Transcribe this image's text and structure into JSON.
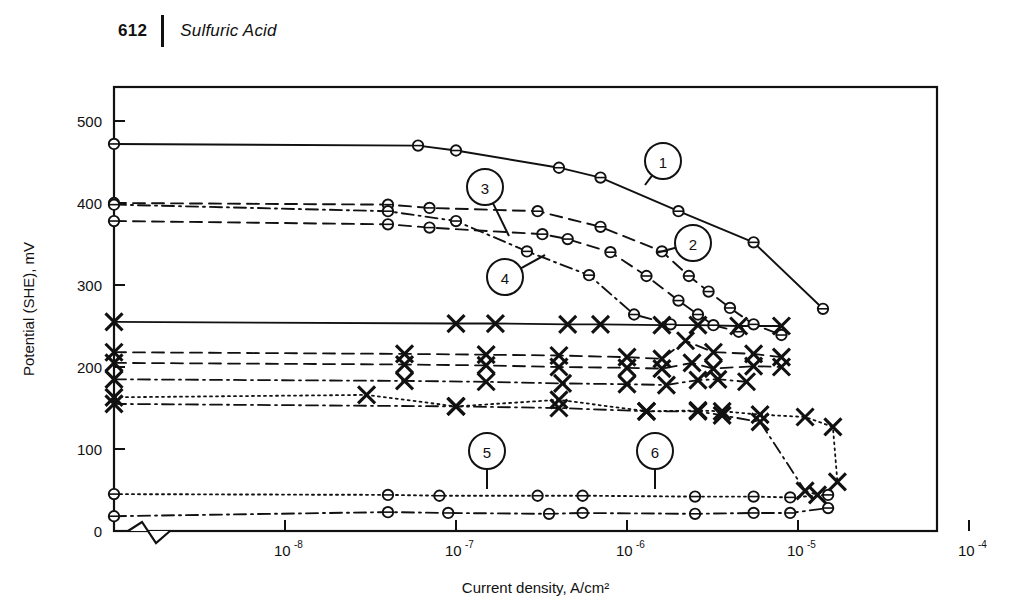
{
  "page": {
    "number": "612",
    "running_title": "Sulfuric Acid"
  },
  "chart_data": {
    "type": "line",
    "title": "",
    "xlabel": "Current density, A/cm²",
    "ylabel": "Potential (SHE), mV",
    "xscale": "log",
    "xlim": [
      1e-09,
      0.0001
    ],
    "ylim": [
      0,
      520
    ],
    "yticks": [
      0,
      100,
      200,
      300,
      400,
      500
    ],
    "xticks": [
      1e-08,
      1e-07,
      1e-06,
      1e-05,
      0.0001
    ],
    "xtick_labels": [
      "10-8",
      "10-7",
      "10-6",
      "10-5",
      "10-4"
    ],
    "grid": false,
    "legend": "none",
    "axis_break": true,
    "marker_styles": [
      "circle-with-tick",
      "cross"
    ],
    "callouts": [
      {
        "label": "1",
        "cx": 663,
        "cy": 161,
        "tx": 645,
        "ty": 185
      },
      {
        "label": "2",
        "cx": 693,
        "cy": 243,
        "tx": 656,
        "ty": 253
      },
      {
        "label": "3",
        "cx": 485,
        "cy": 187,
        "tx": 509,
        "ty": 236
      },
      {
        "label": "4",
        "cx": 505,
        "cy": 277,
        "tx": 545,
        "ty": 255
      },
      {
        "label": "5",
        "cx": 487,
        "cy": 451,
        "tx": 487,
        "ty": 489
      },
      {
        "label": "6",
        "cx": 655,
        "cy": 451,
        "tx": 655,
        "ty": 489
      }
    ],
    "series": [
      {
        "name": "1",
        "style": "solid",
        "marker": "circle",
        "points": [
          [
            1e-09,
            472
          ],
          [
            6e-08,
            470
          ],
          [
            1e-07,
            464
          ],
          [
            4e-07,
            443
          ],
          [
            7e-07,
            431
          ],
          [
            2e-06,
            390
          ],
          [
            5.5e-06,
            352
          ],
          [
            1.4e-05,
            271
          ]
        ]
      },
      {
        "name": "2",
        "style": "dashed",
        "marker": "circle",
        "points": [
          [
            1e-09,
            400
          ],
          [
            4e-08,
            398
          ],
          [
            7e-08,
            394
          ],
          [
            3e-07,
            390
          ],
          [
            7e-07,
            371
          ],
          [
            1.6e-06,
            341
          ],
          [
            2.3e-06,
            311
          ],
          [
            3e-06,
            292
          ],
          [
            4e-06,
            272
          ],
          [
            5.5e-06,
            252
          ],
          [
            8e-06,
            239
          ]
        ]
      },
      {
        "name": "3",
        "style": "dashed",
        "marker": "circle",
        "points": [
          [
            1e-09,
            378
          ],
          [
            4e-08,
            374
          ],
          [
            7e-08,
            370
          ],
          [
            3.2e-07,
            362
          ],
          [
            4.5e-07,
            356
          ],
          [
            8e-07,
            340
          ],
          [
            1.3e-06,
            311
          ],
          [
            2e-06,
            281
          ],
          [
            2.6e-06,
            264
          ],
          [
            3.2e-06,
            251
          ],
          [
            4.5e-06,
            243
          ]
        ]
      },
      {
        "name": "4",
        "style": "dash-dot",
        "marker": "circle",
        "points": [
          [
            1e-09,
            398
          ],
          [
            4e-08,
            390
          ],
          [
            1e-07,
            378
          ],
          [
            2.6e-07,
            341
          ],
          [
            6e-07,
            312
          ],
          [
            1.1e-06,
            264
          ],
          [
            1.8e-06,
            252
          ]
        ]
      },
      {
        "name": "5",
        "style": "dotted",
        "marker": "circle",
        "points": [
          [
            1e-09,
            45
          ],
          [
            4e-08,
            44
          ],
          [
            8e-08,
            43
          ],
          [
            3e-07,
            43
          ],
          [
            5.5e-07,
            43
          ],
          [
            2.5e-06,
            42
          ],
          [
            5.5e-06,
            42
          ],
          [
            9e-06,
            41
          ],
          [
            1.5e-05,
            44
          ]
        ]
      },
      {
        "name": "6",
        "style": "dash-dot",
        "marker": "circle",
        "points": [
          [
            1e-09,
            18
          ],
          [
            4e-08,
            23
          ],
          [
            9e-08,
            22
          ],
          [
            3.5e-07,
            21
          ],
          [
            5.5e-07,
            22
          ],
          [
            2.5e-06,
            21
          ],
          [
            5.5e-06,
            22
          ],
          [
            9e-06,
            22
          ],
          [
            1.5e-05,
            28
          ]
        ]
      },
      {
        "name": "7",
        "style": "solid",
        "marker": "cross",
        "points": [
          [
            1e-09,
            255
          ],
          [
            1e-07,
            253
          ],
          [
            1.7e-07,
            253
          ],
          [
            4.5e-07,
            252
          ],
          [
            7e-07,
            252
          ],
          [
            1.6e-06,
            251
          ],
          [
            2.6e-06,
            251
          ],
          [
            4.5e-06,
            250
          ],
          [
            8e-06,
            250
          ]
        ]
      },
      {
        "name": "8",
        "style": "dashed",
        "marker": "cross",
        "points": [
          [
            1e-09,
            218
          ],
          [
            5e-08,
            216
          ],
          [
            1.5e-07,
            215
          ],
          [
            4e-07,
            214
          ],
          [
            1e-06,
            212
          ],
          [
            1.6e-06,
            210
          ],
          [
            2.2e-06,
            232
          ],
          [
            3.2e-06,
            218
          ],
          [
            5.5e-06,
            216
          ],
          [
            8e-06,
            212
          ]
        ]
      },
      {
        "name": "9",
        "style": "dashed",
        "marker": "cross",
        "points": [
          [
            1e-09,
            205
          ],
          [
            5e-08,
            203
          ],
          [
            1.5e-07,
            202
          ],
          [
            4e-07,
            200
          ],
          [
            1e-06,
            199
          ],
          [
            1.6e-06,
            198
          ],
          [
            2.4e-06,
            205
          ],
          [
            3.2e-06,
            198
          ],
          [
            5.5e-06,
            201
          ],
          [
            8e-06,
            200
          ]
        ]
      },
      {
        "name": "10",
        "style": "dash-dot",
        "marker": "cross",
        "points": [
          [
            1e-09,
            185
          ],
          [
            5e-08,
            183
          ],
          [
            1.5e-07,
            182
          ],
          [
            4.2e-07,
            180
          ],
          [
            1e-06,
            179
          ],
          [
            1.7e-06,
            178
          ],
          [
            2.6e-06,
            184
          ],
          [
            3.4e-06,
            185
          ],
          [
            5e-06,
            182
          ]
        ]
      },
      {
        "name": "11",
        "style": "dotted",
        "marker": "cross",
        "points": [
          [
            1e-09,
            163
          ],
          [
            3e-08,
            166
          ],
          [
            1e-07,
            152
          ],
          [
            4e-07,
            160
          ],
          [
            1.3e-06,
            146
          ],
          [
            2.6e-06,
            147
          ],
          [
            3.6e-06,
            146
          ],
          [
            6e-06,
            142
          ],
          [
            1.1e-05,
            139
          ],
          [
            1.6e-05,
            127
          ],
          [
            1.7e-05,
            60
          ]
        ]
      },
      {
        "name": "12",
        "style": "dash-dot",
        "marker": "cross",
        "points": [
          [
            1e-09,
            155
          ],
          [
            1e-07,
            152
          ],
          [
            4e-07,
            150
          ],
          [
            1.3e-06,
            146
          ],
          [
            2.6e-06,
            146
          ],
          [
            3.6e-06,
            141
          ],
          [
            6e-06,
            133
          ],
          [
            1.1e-05,
            49
          ],
          [
            1.3e-05,
            44
          ]
        ]
      }
    ]
  },
  "geometry": {
    "plot_left": 114,
    "plot_right": 937,
    "plot_top": 87,
    "plot_bottom": 531,
    "x_decade_px": 171,
    "x_ref_value": 1e-08,
    "x_ref_px": 285,
    "y_zero_px": 531,
    "y_per_100mv_px": 82,
    "break_x": 150
  }
}
